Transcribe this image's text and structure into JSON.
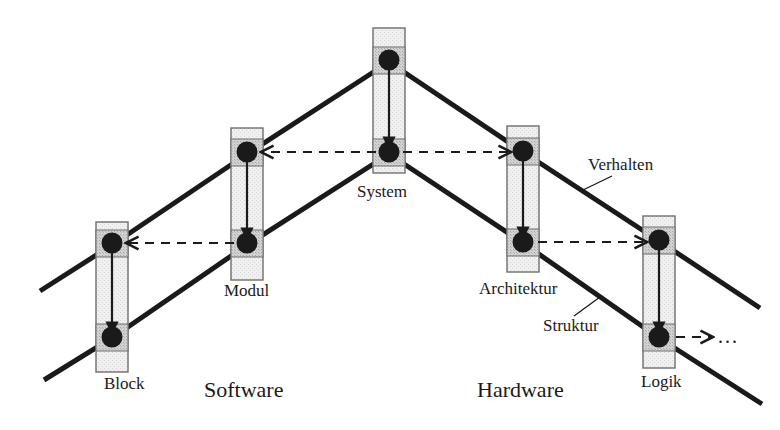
{
  "diagram": {
    "colors": {
      "line": "#1a1a1a",
      "node_fill_light": "#ebebeb",
      "node_fill_band": "#c9c9c9",
      "node_stroke": "#6e6e6e",
      "circle": "#1a1a1a",
      "text": "#1a1a1a",
      "background": "#ffffff"
    },
    "nodes": [
      {
        "id": "block",
        "label": "Block",
        "x": 96,
        "y": 222,
        "w": 32,
        "h": 150,
        "top_circle_y": 243,
        "bottom_circle_y": 337,
        "label_x": 104,
        "label_y": 374
      },
      {
        "id": "modul",
        "label": "Modul",
        "x": 231,
        "y": 128,
        "w": 32,
        "h": 152,
        "top_circle_y": 152,
        "bottom_circle_y": 243,
        "label_x": 224,
        "label_y": 281
      },
      {
        "id": "system",
        "label": "System",
        "x": 373,
        "y": 28,
        "w": 32,
        "h": 145,
        "top_circle_y": 60,
        "bottom_circle_y": 152,
        "label_x": 357,
        "label_y": 182
      },
      {
        "id": "architektur",
        "label": "Architektur",
        "x": 507,
        "y": 126,
        "w": 32,
        "h": 146,
        "top_circle_y": 151,
        "bottom_circle_y": 242,
        "label_x": 479,
        "label_y": 279
      },
      {
        "id": "logik",
        "label": "Logik",
        "x": 643,
        "y": 216,
        "w": 32,
        "h": 152,
        "top_circle_y": 240,
        "bottom_circle_y": 337,
        "label_x": 641,
        "label_y": 372
      }
    ],
    "annotations": {
      "verhalten": {
        "label": "Verhalten",
        "x": 588,
        "y": 155
      },
      "struktur": {
        "label": "Struktur",
        "x": 543,
        "y": 316
      },
      "software": {
        "label": "Software",
        "x": 204,
        "y": 377
      },
      "hardware": {
        "label": "Hardware",
        "x": 477,
        "y": 377
      },
      "ellipsis": {
        "label": "...",
        "x": 718,
        "y": 325
      }
    },
    "edges": {
      "behaviour_chain": [
        "system.top",
        "modul.top",
        "block.top",
        "architektur.top",
        "logik.top"
      ],
      "structure_chain": [
        "system.bottom",
        "modul.bottom",
        "block.bottom",
        "architektur.bottom",
        "logik.bottom"
      ],
      "refinement_arrows": [
        "block.top->block.bottom",
        "modul.top->modul.bottom",
        "system.top->system.bottom",
        "architektur.top->architektur.bottom",
        "logik.top->logik.bottom"
      ],
      "dashed_arrows": [
        "system.top->modul.top",
        "modul.bottom->block.top",
        "system.bottom->architektur.top",
        "architektur.bottom->logik.top",
        "logik.bottom->ellipsis"
      ]
    }
  }
}
